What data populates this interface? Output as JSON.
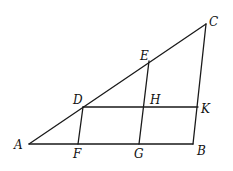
{
  "diagram": {
    "type": "geometry-figure",
    "points": {
      "A": {
        "label": "A",
        "x": 29,
        "y": 144,
        "lx": 14,
        "ly": 149
      },
      "B": {
        "label": "B",
        "x": 193,
        "y": 144,
        "lx": 197,
        "ly": 155
      },
      "C": {
        "label": "C",
        "x": 206,
        "y": 24,
        "lx": 209,
        "ly": 26
      },
      "D": {
        "label": "D",
        "x": 83,
        "y": 107,
        "lx": 73,
        "ly": 104
      },
      "E": {
        "label": "E",
        "x": 149,
        "y": 61,
        "lx": 140,
        "ly": 60
      },
      "F": {
        "label": "F",
        "x": 78,
        "y": 144,
        "lx": 73,
        "ly": 158
      },
      "G": {
        "label": "G",
        "x": 139,
        "y": 144,
        "lx": 134,
        "ly": 158
      },
      "H": {
        "label": "H",
        "x": 144,
        "y": 107,
        "lx": 150,
        "ly": 104
      },
      "K": {
        "label": "K",
        "x": 198,
        "y": 107,
        "lx": 201,
        "ly": 113
      }
    },
    "segments": [
      [
        "A",
        "C"
      ],
      [
        "A",
        "B"
      ],
      [
        "C",
        "B"
      ],
      [
        "D",
        "K"
      ],
      [
        "D",
        "F"
      ],
      [
        "E",
        "G"
      ]
    ]
  }
}
